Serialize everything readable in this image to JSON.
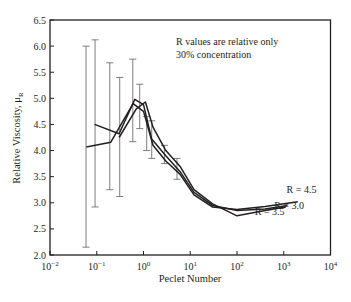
{
  "chart_data": {
    "type": "line",
    "title": "",
    "xlabel": "Peclet Number",
    "ylabel": "Relative Viscosity, μR",
    "xscale": "log",
    "xlim": [
      0.01,
      10000
    ],
    "ylim": [
      2.0,
      6.5
    ],
    "x_ticks": [
      {
        "exp": "-2",
        "value": 0.01
      },
      {
        "exp": "-1",
        "value": 0.1
      },
      {
        "exp": "0",
        "value": 1
      },
      {
        "exp": "1",
        "value": 10
      },
      {
        "exp": "2",
        "value": 100
      },
      {
        "exp": "3",
        "value": 1000
      },
      {
        "exp": "4",
        "value": 10000
      }
    ],
    "y_ticks": [
      "2.0",
      "2.5",
      "3.0",
      "3.5",
      "4.0",
      "4.5",
      "5.0",
      "5.5",
      "6.0",
      "6.5"
    ],
    "grid": false,
    "annotations": [
      "R values are relative only",
      "30% concentration"
    ],
    "series": [
      {
        "name": "R = 4.5",
        "x": [
          0.06,
          0.2,
          0.6,
          1.0,
          1.6,
          3.0,
          6.0,
          12,
          30,
          100,
          400,
          2000
        ],
        "y": [
          4.07,
          4.16,
          4.9,
          4.75,
          4.1,
          3.8,
          3.55,
          3.15,
          2.92,
          2.87,
          2.93,
          3.02
        ]
      },
      {
        "name": "R = 3.0",
        "x": [
          0.09,
          0.3,
          0.65,
          1.0,
          1.5,
          3.0,
          6.0,
          12,
          30,
          100,
          400,
          1200
        ],
        "y": [
          4.5,
          4.32,
          4.98,
          4.88,
          4.22,
          3.9,
          3.6,
          3.2,
          2.95,
          2.85,
          2.88,
          2.95
        ]
      },
      {
        "name": "R = 3.5",
        "x": [
          0.3,
          0.7,
          1.1,
          1.6,
          3.0,
          6.0,
          12,
          30,
          100,
          400,
          1100
        ],
        "y": [
          4.25,
          4.8,
          4.93,
          4.45,
          4.0,
          3.7,
          3.25,
          2.98,
          2.75,
          2.85,
          2.92
        ]
      }
    ],
    "error_bars": [
      {
        "x": 0.059,
        "low": 2.15,
        "high": 6.0
      },
      {
        "x": 0.092,
        "low": 2.92,
        "high": 6.12
      },
      {
        "x": 0.19,
        "low": 3.25,
        "high": 5.68
      },
      {
        "x": 0.31,
        "low": 3.12,
        "high": 5.4
      },
      {
        "x": 0.59,
        "low": 4.17,
        "high": 5.75
      },
      {
        "x": 0.83,
        "low": 4.42,
        "high": 5.27
      },
      {
        "x": 1.17,
        "low": 4.0,
        "high": 4.65
      },
      {
        "x": 1.5,
        "low": 3.85,
        "high": 4.57
      },
      {
        "x": 2.8,
        "low": 3.75,
        "high": 4.1
      },
      {
        "x": 5.2,
        "low": 3.45,
        "high": 3.85
      }
    ],
    "series_labels": [
      {
        "text": "R = 4.5",
        "x": 2400,
        "y": 3.18
      },
      {
        "text": "R = 3.0",
        "x": 1300,
        "y": 2.88
      },
      {
        "text": "R = 3.5",
        "x": 500,
        "y": 2.76
      }
    ]
  },
  "colors": {
    "line": "#231f20",
    "error_bar": "#6d6e71",
    "frame": "#231f20",
    "background": "#ffffff"
  }
}
